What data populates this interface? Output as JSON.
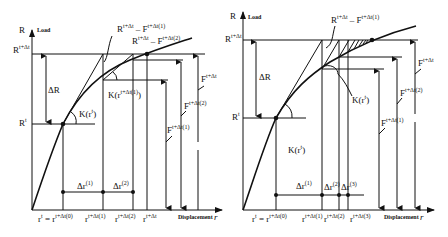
{
  "figure": {
    "left_panel": {
      "name": "Newton-Raphson iteration (full Newton)",
      "y_axis": {
        "symbol": "R",
        "label": "Load"
      },
      "x_axis": {
        "label": "Displacement",
        "symbol": "r"
      },
      "y_levels": {
        "R_t": "R",
        "R_t_sup": "t",
        "R_tdt": "R",
        "R_tdt_sup": "t+Δt"
      },
      "delta_R": "ΔR",
      "annotations": {
        "residual1": "R",
        "residual1_sup": "t+Δt",
        "residual1_mid": " – F",
        "residual1_sup2": "t+Δt(1)",
        "residual2": "R",
        "residual2_sup": "t+Δt",
        "residual2_mid": " – F",
        "residual2_sup2": "t+Δt(2)",
        "K_rt": "K(r",
        "K_rt_sup": "t",
        "K_rt_close": ")",
        "K_r1": "K(r",
        "K_r1_sup": "t+Δt(1)",
        "K_r1_close": ")",
        "F_tdt": "F",
        "F_tdt_sup": "t+Δt",
        "F_2": "F",
        "F_2_sup": "t+Δt(2)",
        "F_1": "F",
        "F_1_sup": "t+Δt(1)"
      },
      "increments": [
        {
          "label": "Δr",
          "sup": "(1)"
        },
        {
          "label": "Δr",
          "sup": "(2)"
        }
      ],
      "x_ticks": [
        {
          "label": "r",
          "sup": "t",
          "eq": " = r",
          "sup2": "t+Δt(0)"
        },
        {
          "label": "r",
          "sup": "t+Δt(1)"
        },
        {
          "label": "r",
          "sup": "t+Δt(2)"
        },
        {
          "label": "r",
          "sup": "t+Δt"
        }
      ]
    },
    "right_panel": {
      "name": "Modified Newton-Raphson iteration",
      "y_axis": {
        "symbol": "R",
        "label": "Load"
      },
      "x_axis": {
        "label": "Displacement",
        "symbol": "r"
      },
      "y_levels": {
        "R_t": "R",
        "R_t_sup": "t",
        "R_tdt": "R",
        "R_tdt_sup": "t+Δt"
      },
      "delta_R": "ΔR",
      "annotations": {
        "residual1": "R",
        "residual1_sup": "t+Δt",
        "residual1_mid": " – F",
        "residual1_sup2": "t+Δt(1)",
        "K_rt_upper": "K(r",
        "K_rt_upper_sup": "t",
        "K_rt_upper_close": ")",
        "K_rt_lower": "K(r",
        "K_rt_lower_sup": "t",
        "K_rt_lower_close": ")",
        "F_tdt": "F",
        "F_tdt_sup": "t+Δt",
        "F_2": "F",
        "F_2_sup": "t+Δt(2)",
        "F_1": "F",
        "F_1_sup": "t+Δt(1)"
      },
      "increments": [
        {
          "label": "Δr",
          "sup": "(1)"
        },
        {
          "label": "Δr",
          "sup": "(2)"
        },
        {
          "label": "Δr",
          "sup": "(3)"
        }
      ],
      "x_ticks": [
        {
          "label": "r",
          "sup": "t",
          "eq": " = r",
          "sup2": "t+Δt(0)"
        },
        {
          "label": "r",
          "sup": "t+Δt(1)"
        },
        {
          "label": "r",
          "sup": "t+Δt(2)"
        },
        {
          "label": "r",
          "sup": "t+Δt(3)"
        }
      ]
    }
  }
}
